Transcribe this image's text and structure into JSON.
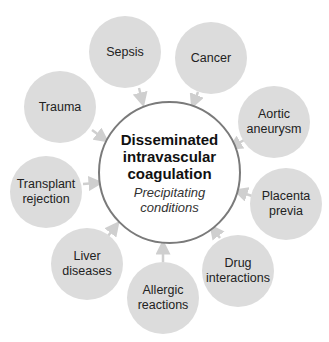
{
  "center": {
    "title": "Disseminated\nintravascular\ncoagulation",
    "subtitle": "Precipitating\nconditions",
    "border_color": "#7a7a7a"
  },
  "node_color": "#dcdcdc",
  "arrow_color": "#cfcfcf",
  "nodes": [
    {
      "label": "Sepsis"
    },
    {
      "label": "Cancer"
    },
    {
      "label": "Aortic\naneurysm"
    },
    {
      "label": "Placenta\nprevia"
    },
    {
      "label": "Drug\ninteractions"
    },
    {
      "label": "Allergic\nreactions"
    },
    {
      "label": "Liver\ndiseases"
    },
    {
      "label": "Transplant\nrejection"
    },
    {
      "label": "Trauma"
    }
  ]
}
